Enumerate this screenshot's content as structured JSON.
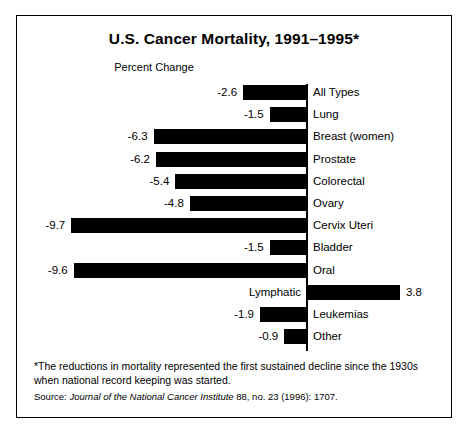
{
  "chart_data": {
    "type": "bar",
    "orientation": "horizontal",
    "title": "U.S. Cancer Mortality, 1991–1995*",
    "xlabel": "Percent Change",
    "ylabel": "",
    "grid": false,
    "legend": null,
    "xlim": [
      -10.5,
      4.5
    ],
    "zero_axis": true,
    "bar_color": "#000000",
    "categories": [
      "All Types",
      "Lung",
      "Breast (women)",
      "Prostate",
      "Colorectal",
      "Ovary",
      "Cervix Uteri",
      "Bladder",
      "Oral",
      "Lymphatic",
      "Leukemias",
      "Other"
    ],
    "values": [
      -2.6,
      -1.5,
      -6.3,
      -6.2,
      -5.4,
      -4.8,
      -9.7,
      -1.5,
      -9.6,
      3.8,
      -1.9,
      -0.9
    ],
    "value_labels": [
      "-2.6",
      "-1.5",
      "-6.3",
      "-6.2",
      "-5.4",
      "-4.8",
      "-9.7",
      "-1.5",
      "-9.6",
      "3.8",
      "-1.9",
      "-0.9"
    ],
    "rows": [
      {
        "label": "All Types",
        "value": -2.6,
        "value_label": "-2.6",
        "label_side": "right",
        "value_side": "left"
      },
      {
        "label": "Lung",
        "value": -1.5,
        "value_label": "-1.5",
        "label_side": "right",
        "value_side": "left"
      },
      {
        "label": "Breast (women)",
        "value": -6.3,
        "value_label": "-6.3",
        "label_side": "right",
        "value_side": "left"
      },
      {
        "label": "Prostate",
        "value": -6.2,
        "value_label": "-6.2",
        "label_side": "right",
        "value_side": "left"
      },
      {
        "label": "Colorectal",
        "value": -5.4,
        "value_label": "-5.4",
        "label_side": "right",
        "value_side": "left"
      },
      {
        "label": "Ovary",
        "value": -4.8,
        "value_label": "-4.8",
        "label_side": "right",
        "value_side": "left"
      },
      {
        "label": "Cervix Uteri",
        "value": -9.7,
        "value_label": "-9.7",
        "label_side": "right",
        "value_side": "left"
      },
      {
        "label": "Bladder",
        "value": -1.5,
        "value_label": "-1.5",
        "label_side": "right",
        "value_side": "left"
      },
      {
        "label": "Oral",
        "value": -9.6,
        "value_label": "-9.6",
        "label_side": "right",
        "value_side": "left"
      },
      {
        "label": "Lymphatic",
        "value": 3.8,
        "value_label": "3.8",
        "label_side": "left",
        "value_side": "right"
      },
      {
        "label": "Leukemias",
        "value": -1.9,
        "value_label": "-1.9",
        "label_side": "right",
        "value_side": "left"
      },
      {
        "label": "Other",
        "value": -0.9,
        "value_label": "-0.9",
        "label_side": "right",
        "value_side": "left"
      }
    ]
  },
  "footnote": {
    "note": "*The reductions in mortality represented the first sustained decline since the 1930s when national record keeping was started.",
    "source_prefix": "Source: ",
    "source_journal": "Journal of the National Cancer Institute",
    "source_suffix": " 88, no. 23 (1996): 1707."
  }
}
